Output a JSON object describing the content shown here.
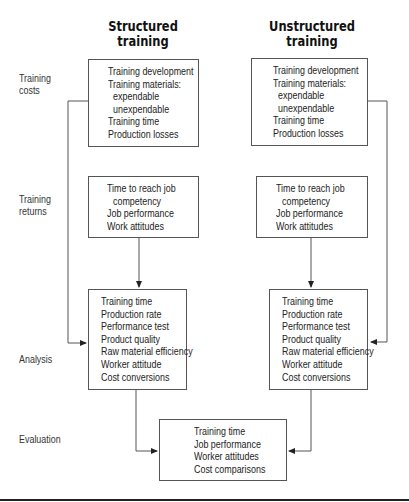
{
  "columns": {
    "structured": {
      "title_line1": "Structured",
      "title_line2": "training"
    },
    "unstructured": {
      "title_line1": "Unstructured",
      "title_line2": "training"
    }
  },
  "row_labels": {
    "costs": {
      "line1": "Training",
      "line2": "costs"
    },
    "returns": {
      "line1": "Training",
      "line2": "returns"
    },
    "analysis": {
      "line1": "Analysis"
    },
    "evaluation": {
      "line1": "Evaluation"
    }
  },
  "boxes": {
    "structured_costs": [
      "Training development",
      "Training materials:",
      "expendable",
      "unexpendable",
      "Training time",
      "Production losses"
    ],
    "unstructured_costs": [
      "Training development",
      "Training materials:",
      "expendable",
      "unexpendable",
      "Training time",
      "Production losses"
    ],
    "structured_returns": [
      "Time to reach job",
      "competency",
      "Job performance",
      "Work attitudes"
    ],
    "unstructured_returns": [
      "Time to reach job",
      "competency",
      "Job performance",
      "Work attitudes"
    ],
    "structured_analysis": [
      "Training time",
      "Production rate",
      "Performance test",
      "Product quality",
      "Raw material efficiency",
      "Worker attitude",
      "Cost conversions"
    ],
    "unstructured_analysis": [
      "Training time",
      "Production rate",
      "Performance test",
      "Product quality",
      "Raw material efficiency",
      "Worker attitude",
      "Cost conversions"
    ],
    "evaluation": [
      "Training time",
      "Job performance",
      "Worker attitudes",
      "Cost comparisons"
    ]
  },
  "colors": {
    "line": "#555555",
    "text": "#222222",
    "rule": "#222222"
  }
}
